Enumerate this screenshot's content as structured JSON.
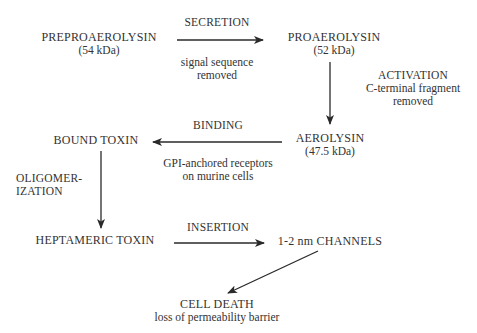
{
  "diagram": {
    "title": "",
    "colors": {
      "text": "#333333",
      "arrow": "#2a2a2a",
      "background": "#ffffff"
    },
    "nodes": {
      "preproaerolysin": {
        "label": "PREPROAEROLYSIN",
        "detail": "(54 kDa)"
      },
      "proaerolysin": {
        "label": "PROAEROLYSIN",
        "detail": "(52 kDa)"
      },
      "aerolysin": {
        "label": "AEROLYSIN",
        "detail": "(47.5 kDa)"
      },
      "bound_toxin": {
        "label": "BOUND TOXIN"
      },
      "heptameric_toxin": {
        "label": "HEPTAMERIC TOXIN"
      },
      "channels": {
        "label": "1-2 nm CHANNELS"
      },
      "cell_death": {
        "label": "CELL DEATH",
        "detail": "loss of permeability barrier"
      }
    },
    "edges": {
      "secretion": {
        "from": "PREPROAEROLYSIN",
        "to": "PROAEROLYSIN",
        "label": "SECRETION",
        "note_line1": "signal sequence",
        "note_line2": "removed"
      },
      "activation": {
        "from": "PROAEROLYSIN",
        "to": "AEROLYSIN",
        "label": "ACTIVATION",
        "note_line1": "C-terminal fragment",
        "note_line2": "removed"
      },
      "binding": {
        "from": "AEROLYSIN",
        "to": "BOUND TOXIN",
        "label": "BINDING",
        "note_line1": "GPI-anchored receptors",
        "note_line2": "on murine cells"
      },
      "oligomerization": {
        "from": "BOUND TOXIN",
        "to": "HEPTAMERIC TOXIN",
        "label_line1": "OLIGOMER-",
        "label_line2": "IZATION"
      },
      "insertion": {
        "from": "HEPTAMERIC TOXIN",
        "to": "1-2 nm CHANNELS",
        "label": "INSERTION"
      },
      "death": {
        "from": "1-2 nm CHANNELS",
        "to": "CELL DEATH"
      }
    }
  }
}
